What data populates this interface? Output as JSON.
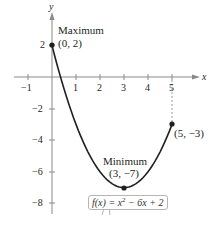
{
  "chart_data": {
    "type": "line",
    "title": "",
    "xlabel": "x",
    "ylabel": "y",
    "xlim": [
      -1.5,
      6
    ],
    "ylim": [
      -9,
      3.5
    ],
    "grid": false,
    "x_ticks": [
      -1,
      1,
      2,
      3,
      4,
      5
    ],
    "y_ticks": [
      2,
      -2,
      -4,
      -6,
      -8
    ],
    "x_tick_labels": [
      "−1",
      "1",
      "2",
      "3",
      "4",
      "5"
    ],
    "y_tick_labels": [
      "2",
      "−2",
      "−4",
      "−6",
      "−8"
    ],
    "series": [
      {
        "name": "f(x) = x² − 6x + 2",
        "function": "x^2 - 6x + 2",
        "domain": [
          0,
          5
        ],
        "x": [
          0,
          0.5,
          1,
          1.5,
          2,
          2.5,
          3,
          3.5,
          4,
          4.5,
          5
        ],
        "y": [
          2,
          -0.75,
          -3,
          -4.75,
          -6,
          -6.75,
          -7,
          -6.75,
          -6,
          -4.75,
          -3
        ]
      }
    ],
    "points": [
      {
        "x": 0,
        "y": 2,
        "label": "Maximum",
        "coords": "(0, 2)"
      },
      {
        "x": 3,
        "y": -7,
        "label": "Minimum",
        "coords": "(3, −7)"
      },
      {
        "x": 5,
        "y": -3,
        "label": "",
        "coords": "(5, −3)"
      }
    ],
    "annotations": {
      "max_title": "Maximum",
      "max_coords": "(0, 2)",
      "min_title": "Minimum",
      "min_coords": "(3, −7)",
      "end_coords": "(5, −3)",
      "formula_lhs": "f(x)",
      "formula_rhs": " = x",
      "formula_exp": "2",
      "formula_tail": " − 6x + 2"
    }
  }
}
